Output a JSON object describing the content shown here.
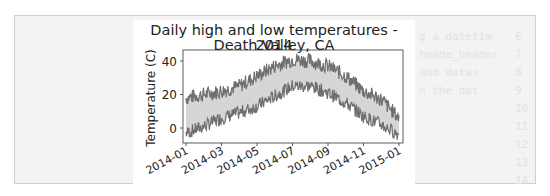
{
  "background_ghost_text": [
    {
      "text": "g a datetim",
      "num": "6"
    },
    {
      "text": "heade_header",
      "num": "7"
    },
    {
      "text": "and datas",
      "num": "8"
    },
    {
      "text": "n the dat",
      "num": "9"
    },
    {
      "text": "",
      "num": "10"
    },
    {
      "text": "",
      "num": "11"
    },
    {
      "text": "",
      "num": "12"
    },
    {
      "text": "",
      "num": "13"
    },
    {
      "text": "",
      "num": "14"
    }
  ],
  "chart_data": {
    "type": "line",
    "title": "Daily high and low temperatures - 2014",
    "subtitle": "Death Valley, CA",
    "xlabel": "",
    "ylabel": "Temperature (C)",
    "ylim": [
      -6,
      46
    ],
    "xlim": [
      "2014-01-01",
      "2015-01-01"
    ],
    "x_ticks": [
      "2014-01",
      "2014-03",
      "2014-05",
      "2014-07",
      "2014-09",
      "2014-11",
      "2015-01"
    ],
    "y_ticks": [
      0,
      20,
      40
    ],
    "grid": false,
    "legend": null,
    "fill_between": {
      "color": "#d6d6d6",
      "description": "shaded region between highs and lows"
    },
    "x": [
      "2014-01",
      "2014-02",
      "2014-03",
      "2014-04",
      "2014-05",
      "2014-06",
      "2014-07",
      "2014-08",
      "2014-09",
      "2014-10",
      "2014-11",
      "2014-12",
      "2015-01"
    ],
    "series": [
      {
        "name": "Highs",
        "color": "#6f6f6f",
        "values": [
          18,
          20,
          22,
          25,
          31,
          37,
          41,
          40,
          37,
          31,
          22,
          17,
          6
        ]
      },
      {
        "name": "Lows",
        "color": "#6f6f6f",
        "values": [
          -3,
          1,
          6,
          9,
          13,
          19,
          25,
          25,
          21,
          15,
          7,
          2,
          -4
        ]
      }
    ]
  }
}
